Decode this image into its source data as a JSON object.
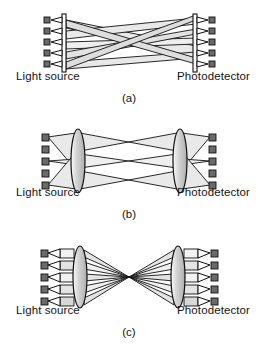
{
  "figure": {
    "panel_count": 3
  },
  "colors": {
    "beam_fill": "#e9e9e9",
    "beam_fill_dark": "#d2d2d2",
    "outline": "#111111",
    "lens_fill": "#d8d8d8",
    "lens_fill_light": "#f0f0f0",
    "emitter_fill": "#5a5a5a",
    "background": "#ffffff",
    "text": "#141414"
  },
  "panels": [
    {
      "id": "a",
      "caption": "(a)",
      "source_label": "Light source",
      "detector_label": "Photodetector",
      "source_count": 5,
      "detector_count": 5,
      "optics": "none",
      "routing": "free-space crossing beams",
      "description": "Five sources fan out in crossing cone beams directly to five detectors"
    },
    {
      "id": "b",
      "caption": "(b)",
      "source_label": "Light source",
      "detector_label": "Photodetector",
      "source_count": 5,
      "detector_count": 5,
      "active_source_count": 3,
      "optics": "single lens each side",
      "routing": "lens-collimated bowtie",
      "description": "Three active sources through a lens, beams cross at mid-plane, second lens to detectors"
    },
    {
      "id": "c",
      "caption": "(c)",
      "source_label": "Light source",
      "detector_label": "Photodetector",
      "source_count": 5,
      "detector_count": 5,
      "optics": "single lens each side",
      "routing": "lens focused to common point",
      "description": "Five collimated channels focused by a lens to a single crossover point, then re-imaged"
    }
  ]
}
